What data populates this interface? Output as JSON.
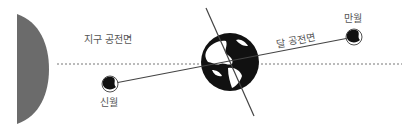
{
  "diagram": {
    "title": "",
    "labels": {
      "earth_orbit_plane": "지구 공전면",
      "moon_orbit_plane": "달 공전면",
      "new_moon": "신월",
      "full_moon": "만월"
    },
    "colors": {
      "sun": "#6b6b6b",
      "earth_land": "#ffffff",
      "earth_ocean": "#111111",
      "line": "#444444",
      "dashed": "#777777",
      "text": "#555555"
    },
    "elements": [
      {
        "name": "sun",
        "shape": "half-disk",
        "note": "left edge of image"
      },
      {
        "name": "earth",
        "center": [
          230,
          62
        ],
        "radius": 29
      },
      {
        "name": "earth-axis",
        "from": [
          206,
          8
        ],
        "to": [
          254,
          116
        ]
      },
      {
        "name": "earth-orbit-plane",
        "style": "dashed",
        "y": 64,
        "x_range": [
          57,
          402
        ]
      },
      {
        "name": "moon-orbit-plane",
        "style": "solid",
        "from": [
          110,
          84
        ],
        "to": [
          354,
          37
        ]
      },
      {
        "name": "new-moon",
        "center": [
          110,
          84
        ],
        "radius": 8
      },
      {
        "name": "full-moon",
        "center": [
          354,
          37
        ],
        "radius": 8
      }
    ]
  }
}
